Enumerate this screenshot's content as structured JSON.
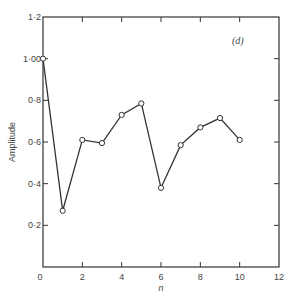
{
  "chart_data": {
    "type": "line",
    "title": "",
    "panel_label": "(d)",
    "xlabel": "n",
    "ylabel": "Amplitude",
    "xlim": [
      0,
      12
    ],
    "ylim": [
      0,
      1.2
    ],
    "x_ticks": [
      0,
      2,
      4,
      6,
      8,
      10,
      12
    ],
    "x_tick_labels": [
      "0",
      "2",
      "4",
      "6",
      "8",
      "10",
      "12"
    ],
    "y_ticks": [
      0.2,
      0.4,
      0.6,
      0.8,
      1.0,
      1.2
    ],
    "y_tick_labels": [
      "0·2",
      "0·4",
      "0·6",
      "0·8",
      "1·00",
      "1·2"
    ],
    "grid": false,
    "legend": null,
    "marker": "open-circle",
    "x": [
      0,
      1,
      2,
      3,
      4,
      5,
      6,
      7,
      8,
      9,
      10
    ],
    "series": [
      {
        "name": "Amplitude",
        "values": [
          1.0,
          0.27,
          0.61,
          0.595,
          0.73,
          0.785,
          0.38,
          0.585,
          0.67,
          0.715,
          0.61
        ]
      }
    ]
  }
}
